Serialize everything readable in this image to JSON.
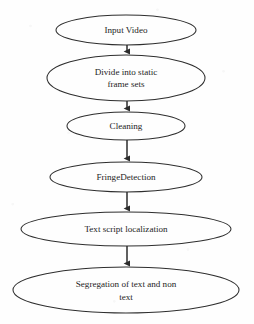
{
  "diagram": {
    "type": "flowchart",
    "orientation": "vertical-top-to-bottom",
    "background_color": "#fefefe",
    "stroke_color": "#2e2e2e",
    "text_color": "#1d1d1d",
    "node_shape": "ellipse",
    "nodes": [
      {
        "id": "input-video",
        "label": "Input Video",
        "lines": [
          "Input Video"
        ],
        "cx": 126,
        "cy": 30,
        "rx": 70,
        "ry": 15
      },
      {
        "id": "divide-into-static-frame-sets",
        "label": "Divide into static frame sets",
        "lines": [
          "Divide into static",
          "frame sets"
        ],
        "cx": 126,
        "cy": 78,
        "rx": 79,
        "ry": 23
      },
      {
        "id": "cleaning",
        "label": "Cleaning",
        "lines": [
          "Cleaning"
        ],
        "cx": 126,
        "cy": 126,
        "rx": 59,
        "ry": 14
      },
      {
        "id": "fringe-detection",
        "label": "FringeDetection",
        "lines": [
          "FringeDetection"
        ],
        "cx": 126,
        "cy": 177,
        "rx": 76,
        "ry": 15
      },
      {
        "id": "text-script-localization",
        "label": "Text script localization",
        "lines": [
          "Text script localization"
        ],
        "cx": 126,
        "cy": 229,
        "rx": 105,
        "ry": 17
      },
      {
        "id": "segregation-of-text-and-non-text",
        "label": "Segregation of text and non text",
        "lines": [
          "Segregation of text and non",
          "text"
        ],
        "cx": 126,
        "cy": 290,
        "rx": 113,
        "ry": 23
      }
    ],
    "connectors": [
      {
        "id": "arrow-input-video-to-divide",
        "from": "input-video",
        "to": "divide-into-static-frame-sets",
        "x": 127,
        "y1": 45,
        "y2": 55
      },
      {
        "id": "arrow-divide-to-cleaning",
        "from": "divide-into-static-frame-sets",
        "to": "cleaning",
        "x": 127,
        "y1": 101,
        "y2": 112
      },
      {
        "id": "arrow-cleaning-to-fringe-detection",
        "from": "cleaning",
        "to": "fringe-detection",
        "x": 127,
        "y1": 140,
        "y2": 162
      },
      {
        "id": "arrow-fringe-detection-to-localization",
        "from": "fringe-detection",
        "to": "text-script-localization",
        "x": 127,
        "y1": 192,
        "y2": 212
      },
      {
        "id": "arrow-localization-to-segregation",
        "from": "text-script-localization",
        "to": "segregation-of-text-and-non-text",
        "x": 127,
        "y1": 246,
        "y2": 267
      }
    ]
  }
}
